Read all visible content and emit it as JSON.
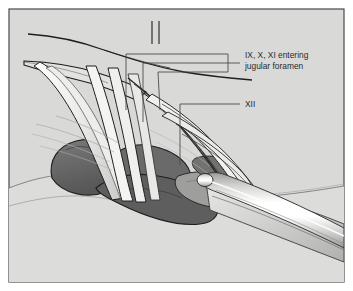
{
  "figure": {
    "kind": "anatomical-illustration",
    "frame": {
      "border_color": "#4a4a4a",
      "background_color": "#d9d9d7",
      "page_color": "#ffffff",
      "width": 353,
      "height": 291
    },
    "palette": {
      "outline": "#1c1c1c",
      "thin_outline": "#555555",
      "leader_line": "#4c4c4c",
      "label_text": "#2b2b2b",
      "tissue_light": "#dbdbd9",
      "tissue_mid": "#c4c4c2",
      "muscle_dark": "#6e6e6e",
      "muscle_darker": "#5a5a5a",
      "vessel_dark": "#636363",
      "nerve_pale": "#f2f2f0",
      "nerve_shadow": "#b9b9b7",
      "instrument_highlight": "#ffffff",
      "instrument_body": "#c8c8c6",
      "instrument_edge": "#8d8d8b"
    },
    "labels": [
      {
        "id": "cn-9-10-11",
        "lines": [
          "IX, X, XI entering",
          "jugular foramen"
        ],
        "text_x": 245,
        "text_y": 58,
        "line_height": 11,
        "bracket": {
          "spine_x": 228,
          "spine_top": 54,
          "spine_bottom": 72,
          "connector_x": 238,
          "connector_y": 63,
          "leaders": [
            {
              "elbow_x": 126,
              "elbow_y": 54,
              "tip_x": 126,
              "tip_y": 110
            },
            {
              "elbow_x": 143,
              "elbow_y": 63,
              "tip_x": 143,
              "tip_y": 122
            },
            {
              "elbow_x": 158,
              "elbow_y": 72,
              "tip_x": 160,
              "tip_y": 110
            }
          ]
        }
      },
      {
        "id": "cn-12",
        "lines": [
          "XII"
        ],
        "text_x": 245,
        "text_y": 107,
        "line_height": 11,
        "bracket": {
          "spine_x": 238,
          "spine_top": 104,
          "spine_bottom": 104,
          "connector_x": 238,
          "connector_y": 104,
          "leaders": [
            {
              "elbow_x": 180,
              "elbow_y": 104,
              "tip_x": 180,
              "tip_y": 165
            }
          ]
        }
      }
    ],
    "annotation_count": 2,
    "nerve_strand_count": 11
  }
}
